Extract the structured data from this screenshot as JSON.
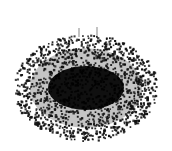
{
  "diagram": {
    "type": "network-graph",
    "background": "#ffffff",
    "node_color": "#111111",
    "core_color": "#000000",
    "spike_color": "#9a9a9a",
    "cloud": {
      "cx": 86,
      "cy": 88,
      "rx": 72,
      "ry": 53,
      "node_count": 1400,
      "node_size": 1.9
    },
    "core": {
      "cx": 86,
      "cy": 88,
      "rx": 38,
      "ry": 22
    },
    "spikes": [
      {
        "x": 79,
        "y1": 28,
        "y2": 37
      },
      {
        "x": 97,
        "y1": 27,
        "y2": 36
      }
    ]
  }
}
